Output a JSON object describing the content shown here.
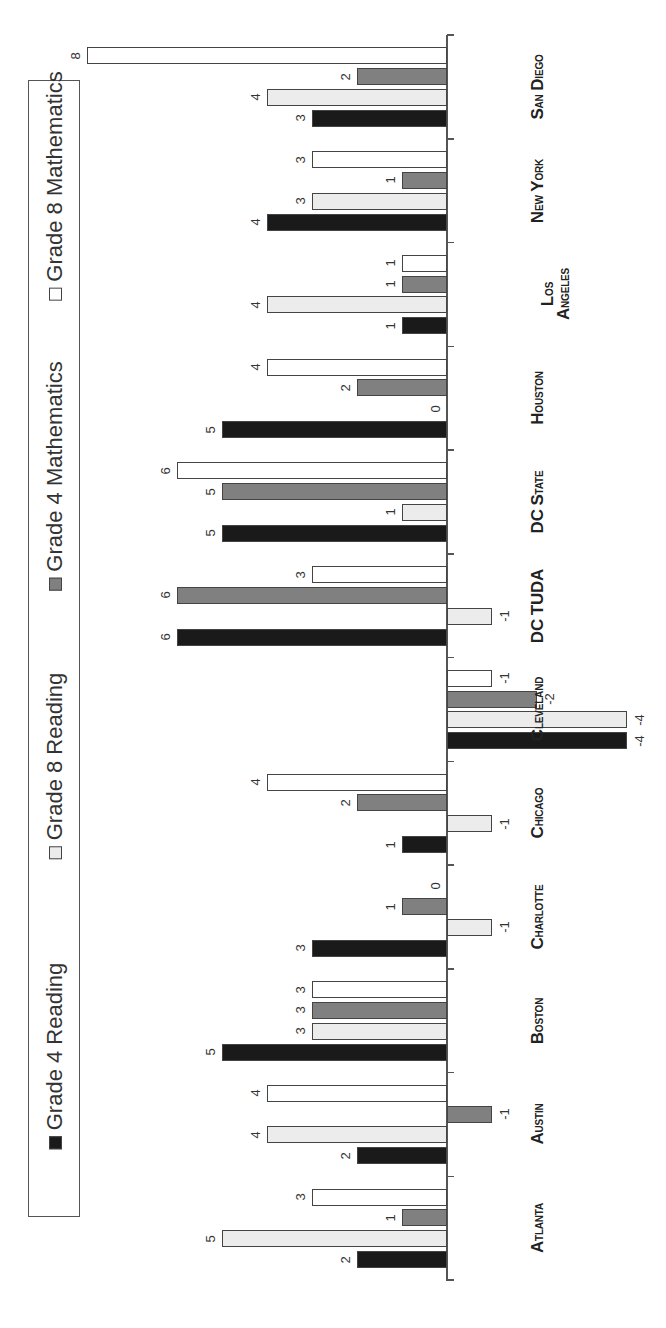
{
  "chart_data": {
    "type": "bar",
    "orientation": "rotated 90deg clockwise (vertical grouped bar chart rendered sideways)",
    "title": "",
    "xlabel": "",
    "ylabel": "",
    "categories": [
      "Atlanta",
      "Austin",
      "Boston",
      "Charlotte",
      "Chicago",
      "Cleveland",
      "DC TUDA",
      "DC State",
      "Houston",
      "Los Angeles",
      "New York",
      "San Diego"
    ],
    "category_labels": [
      "Atlanta",
      "Austin",
      "Boston",
      "Charlotte",
      "Chicago",
      "Cleveland",
      "DC TUDA",
      "DC State",
      "Houston",
      "Los\nAngeles",
      "New York",
      "San Diego"
    ],
    "series": [
      {
        "name": "Grade 4 Reading",
        "color": "#1a1a1a",
        "values": [
          2,
          2,
          5,
          3,
          1,
          -4,
          6,
          5,
          5,
          1,
          4,
          3
        ]
      },
      {
        "name": "Grade 8 Reading",
        "color": "#ececec",
        "values": [
          5,
          4,
          3,
          -1,
          -1,
          -4,
          -1,
          1,
          0,
          4,
          3,
          4
        ]
      },
      {
        "name": "Grade 4 Mathematics",
        "color": "#808080",
        "values": [
          1,
          -1,
          3,
          1,
          2,
          -2,
          6,
          5,
          2,
          1,
          1,
          2
        ]
      },
      {
        "name": "Grade 8 Mathematics",
        "color": "#ffffff",
        "values": [
          3,
          4,
          3,
          0,
          4,
          -1,
          3,
          6,
          4,
          1,
          3,
          8
        ]
      }
    ],
    "ylim": [
      -4,
      8
    ],
    "grid": false,
    "data_labels": true,
    "legend_position": "top (left side of rotated image)"
  },
  "legend": {
    "items": [
      {
        "label": "Grade 4 Reading",
        "color": "#1a1a1a"
      },
      {
        "label": "Grade 8 Reading",
        "color": "#ececec"
      },
      {
        "label": "Grade 4 Mathematics",
        "color": "#808080"
      },
      {
        "label": "Grade 8 Mathematics",
        "color": "#ffffff"
      }
    ]
  }
}
